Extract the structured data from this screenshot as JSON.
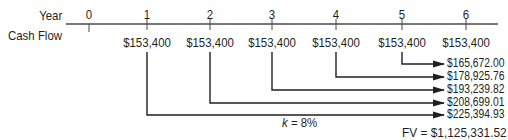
{
  "timeline": {
    "year_label": "Year",
    "cashflow_label": "Cash Flow",
    "years": [
      "0",
      "1",
      "2",
      "3",
      "4",
      "5",
      "6"
    ],
    "cash_flows": [
      "",
      "$153,400",
      "$153,400",
      "$153,400",
      "$153,400",
      "$153,400",
      "$153,400"
    ]
  },
  "future_values": [
    {
      "from_year": "5",
      "value": "$165,672.00"
    },
    {
      "from_year": "4",
      "value": "$178,925.76"
    },
    {
      "from_year": "3",
      "value": "$193,239.82"
    },
    {
      "from_year": "2",
      "value": "$208,699.01"
    },
    {
      "from_year": "1",
      "value": "$225,394.93"
    }
  ],
  "rate": {
    "variable": "k",
    "equals": " = 8%"
  },
  "total": {
    "label": "FV = $1,125,331.52"
  },
  "colors": {
    "line": "#231f20",
    "text": "#231f20"
  }
}
